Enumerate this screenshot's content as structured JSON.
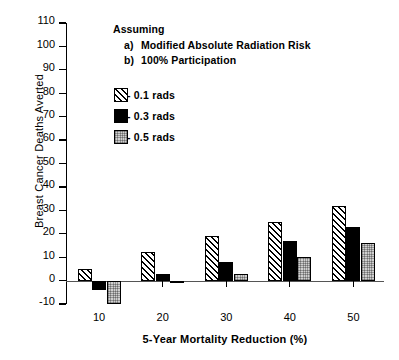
{
  "chart_data": {
    "type": "bar",
    "title": "",
    "xlabel": "5-Year Mortality Reduction (%)",
    "ylabel": "Breast Cancer Deaths Averted",
    "categories": [
      "10",
      "20",
      "30",
      "40",
      "50"
    ],
    "series": [
      {
        "name": "- 0.1 rads",
        "values": [
          5,
          12,
          19,
          25,
          32
        ],
        "fill": "diagonal-hatch"
      },
      {
        "name": "- 0.3 rads",
        "values": [
          -4,
          3,
          8,
          17,
          23
        ],
        "fill": "solid-black"
      },
      {
        "name": "- 0.5 rads",
        "values": [
          -10,
          -1,
          3,
          10,
          16
        ],
        "fill": "gray-stipple"
      }
    ],
    "ylim": [
      -10,
      110
    ],
    "yticks": [
      -10,
      0,
      10,
      20,
      30,
      40,
      50,
      60,
      70,
      80,
      90,
      100,
      110
    ],
    "xticks": [
      "10",
      "20",
      "30",
      "40",
      "50"
    ],
    "grid": false,
    "legend_position": "upper-left-inside",
    "zero_line": true
  },
  "annotation": {
    "heading": "Assuming",
    "items": [
      {
        "key": "a)",
        "text": "Modified Absolute Radiation Risk"
      },
      {
        "key": "b)",
        "text": "100% Participation"
      }
    ]
  },
  "legend": {
    "entries": [
      {
        "label": "- 0.1 rads"
      },
      {
        "label": "- 0.3 rads"
      },
      {
        "label": "- 0.5 rads"
      }
    ]
  },
  "colors": {
    "axis": "#000000",
    "series_0": "#ffffff",
    "series_1": "#000000",
    "series_2": "#d0d0d0",
    "background": "#ffffff"
  }
}
